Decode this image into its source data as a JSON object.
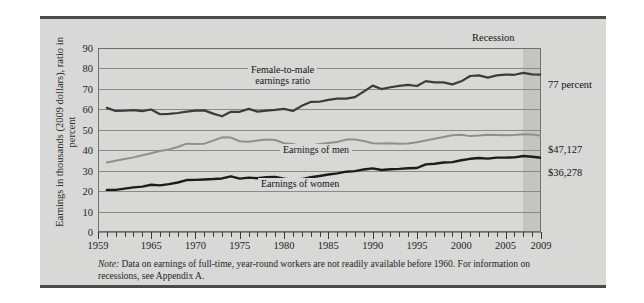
{
  "figure": {
    "y_axis_title": "Earnings in thousands (2009 dollars), ratio in percent",
    "recession_label": "Recession",
    "note_prefix": "Note:",
    "note_text": " Data on earnings of full-time, year-round workers are not readily available before 1960. For information on recessions, see Appendix A.",
    "annotations": {
      "ratio": "Female-to-male earnings ratio",
      "ratio_line1": "Female-to-male",
      "ratio_line2": "earnings ratio",
      "men": "Earnings of men",
      "women": "Earnings of women"
    },
    "end_labels": {
      "ratio": "77 percent",
      "men": "$47,127",
      "women": "$36,278"
    }
  },
  "chart_data": {
    "type": "line",
    "title": "",
    "xlabel": "",
    "ylabel": "Earnings in thousands (2009 dollars), ratio in percent",
    "xlim": [
      1959,
      2009
    ],
    "ylim": [
      0,
      90
    ],
    "ytick_labels": [
      "0",
      "10",
      "20",
      "30",
      "40",
      "50",
      "60",
      "70",
      "80",
      "90"
    ],
    "yticks": [
      0,
      10,
      20,
      30,
      40,
      50,
      60,
      70,
      80,
      90
    ],
    "xtick_labels": [
      "1959",
      "1965",
      "1970",
      "1975",
      "1980",
      "1985",
      "1990",
      "1995",
      "2000",
      "2005",
      "2009"
    ],
    "xticks_labeled": [
      1959,
      1965,
      1970,
      1975,
      1980,
      1985,
      1990,
      1995,
      2000,
      2005,
      2009
    ],
    "xtick_interval": 1,
    "grid": "horizontal",
    "legend": "inline-annotations",
    "recession_band": {
      "start": 2007,
      "end": 2009
    },
    "x": [
      1960,
      1961,
      1962,
      1963,
      1964,
      1965,
      1966,
      1967,
      1968,
      1969,
      1970,
      1971,
      1972,
      1973,
      1974,
      1975,
      1976,
      1977,
      1978,
      1979,
      1980,
      1981,
      1982,
      1983,
      1984,
      1985,
      1986,
      1987,
      1988,
      1989,
      1990,
      1991,
      1992,
      1993,
      1994,
      1995,
      1996,
      1997,
      1998,
      1999,
      2000,
      2001,
      2002,
      2003,
      2004,
      2005,
      2006,
      2007,
      2008,
      2009
    ],
    "series": [
      {
        "name": "Female-to-male earnings ratio",
        "unit": "percent",
        "color": "#3c3c3c",
        "width": 2.2,
        "end_value": 77,
        "values": [
          60.7,
          59.2,
          59.3,
          59.6,
          59.1,
          59.9,
          57.6,
          57.8,
          58.2,
          58.9,
          59.4,
          59.5,
          57.9,
          56.6,
          58.8,
          58.8,
          60.2,
          58.9,
          59.4,
          59.7,
          60.2,
          59.2,
          61.7,
          63.6,
          63.7,
          64.6,
          65.2,
          65.2,
          66.0,
          68.7,
          71.6,
          69.9,
          70.8,
          71.5,
          72.0,
          71.4,
          73.8,
          73.2,
          73.2,
          72.2,
          73.7,
          76.3,
          76.6,
          75.5,
          76.6,
          77.0,
          76.9,
          77.8,
          77.1,
          77.0
        ]
      },
      {
        "name": "Earnings of men",
        "unit": "thousands of 2009 dollars",
        "color": "#8f8f8f",
        "width": 2.0,
        "end_value": 47127,
        "end_value_label": "$47,127",
        "values": [
          34.0,
          34.8,
          35.7,
          36.5,
          37.5,
          38.5,
          39.6,
          40.4,
          41.6,
          43.2,
          43.0,
          43.2,
          44.7,
          46.3,
          46.2,
          44.4,
          44.2,
          44.7,
          45.2,
          45.0,
          43.4,
          43.0,
          42.0,
          42.2,
          43.0,
          43.5,
          44.0,
          45.2,
          45.2,
          44.5,
          43.4,
          43.3,
          43.4,
          43.2,
          43.3,
          43.9,
          44.8,
          45.6,
          46.5,
          47.3,
          47.6,
          46.9,
          47.2,
          47.6,
          47.5,
          47.3,
          47.5,
          47.8,
          47.7,
          47.1
        ]
      },
      {
        "name": "Earnings of women",
        "unit": "thousands of 2009 dollars",
        "color": "#1c1c1c",
        "width": 2.4,
        "end_value": 36278,
        "end_value_label": "$36,278",
        "values": [
          20.6,
          20.6,
          21.2,
          21.8,
          22.2,
          23.1,
          22.8,
          23.4,
          24.2,
          25.4,
          25.5,
          25.7,
          25.9,
          26.2,
          27.2,
          26.1,
          26.6,
          26.3,
          26.8,
          26.9,
          26.1,
          25.5,
          25.9,
          26.8,
          27.4,
          28.1,
          28.7,
          29.5,
          29.8,
          30.6,
          31.1,
          30.3,
          30.7,
          30.9,
          31.2,
          31.3,
          33.1,
          33.4,
          34.0,
          34.2,
          35.1,
          35.8,
          36.2,
          35.9,
          36.4,
          36.4,
          36.5,
          37.2,
          36.8,
          36.3
        ]
      }
    ]
  }
}
